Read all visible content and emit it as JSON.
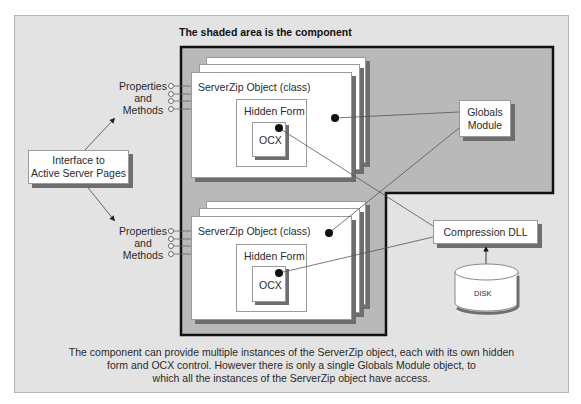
{
  "title": "The shaded area is the component",
  "interface_box": {
    "line1": "Interface to",
    "line2": "Active Server Pages"
  },
  "props_top": {
    "line1": "Properties",
    "line2": "and",
    "line3": "Methods"
  },
  "props_bottom": {
    "line1": "Properties",
    "line2": "and",
    "line3": "Methods"
  },
  "object_top": {
    "label": "ServerZip Object (class)",
    "form": "Hidden Form",
    "ocx": "OCX"
  },
  "object_bottom": {
    "label": "ServerZip Object (class)",
    "form": "Hidden Form",
    "ocx": "OCX"
  },
  "globals": {
    "line1": "Globals",
    "line2": "Module"
  },
  "compression": {
    "label": "Compression DLL"
  },
  "disk": {
    "label": "DISK"
  },
  "caption": {
    "line1": "The component can provide multiple instances of the ServerZip object, each with its own hidden",
    "line2": "form and OCX control. However there is only a single Globals Module object, to",
    "line3": "which all the instances of the ServerZip object have access."
  },
  "colors": {
    "panel": "#e3e3e3",
    "component_shade": "#b9b9b9",
    "component_border": "#111111",
    "shadow": "#6e6e6e"
  }
}
